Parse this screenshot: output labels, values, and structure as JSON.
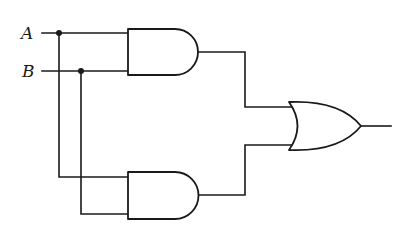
{
  "diagram": {
    "type": "logic-circuit",
    "inputs": [
      {
        "label": "A",
        "y": 33
      },
      {
        "label": "B",
        "y": 71
      }
    ],
    "gates": [
      {
        "id": "and1",
        "type": "AND",
        "inputs": [
          "A",
          "B"
        ]
      },
      {
        "id": "and2",
        "type": "AND",
        "inputs": [
          "A",
          "B"
        ]
      },
      {
        "id": "or1",
        "type": "OR",
        "inputs": [
          "and1",
          "and2"
        ]
      }
    ],
    "output": {
      "from": "or1"
    },
    "colors": {
      "stroke": "#1a1a1a",
      "background": "#ffffff"
    }
  }
}
